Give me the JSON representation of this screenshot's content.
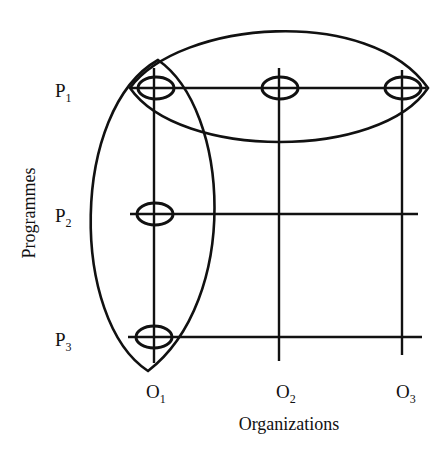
{
  "diagram": {
    "programmes": [
      {
        "label": "P",
        "sub": "1"
      },
      {
        "label": "P",
        "sub": "2"
      },
      {
        "label": "P",
        "sub": "3"
      }
    ],
    "organizations": [
      {
        "label": "O",
        "sub": "1"
      },
      {
        "label": "O",
        "sub": "2"
      },
      {
        "label": "O",
        "sub": "3"
      }
    ],
    "y_axis_label": "Programmes",
    "x_axis_label": "Organizations",
    "nodes": [
      {
        "programme": "P1",
        "organization": "O1"
      },
      {
        "programme": "P1",
        "organization": "O2"
      },
      {
        "programme": "P1",
        "organization": "O3"
      },
      {
        "programme": "P2",
        "organization": "O1"
      },
      {
        "programme": "P3",
        "organization": "O1"
      }
    ],
    "groupings": [
      {
        "name": "programme-P1-grouping",
        "covers": [
          "P1-O1",
          "P1-O2",
          "P1-O3"
        ]
      },
      {
        "name": "organization-O1-grouping",
        "covers": [
          "P1-O1",
          "P2-O1",
          "P3-O1"
        ]
      }
    ]
  }
}
